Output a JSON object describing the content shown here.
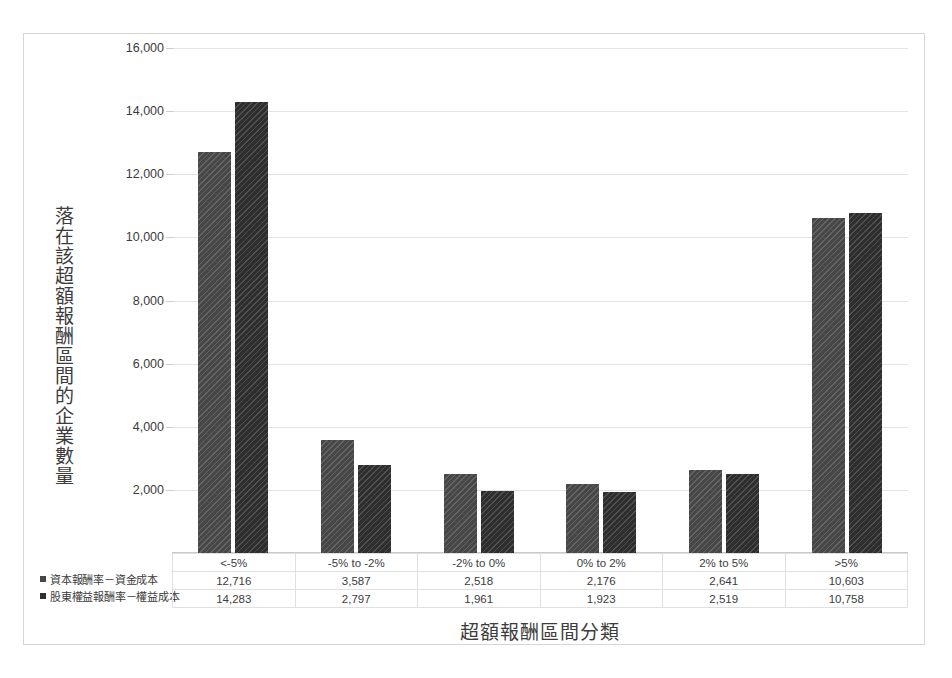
{
  "chart_data": {
    "type": "bar",
    "title": "",
    "xlabel": "超額報酬區間分類",
    "ylabel": "落在該超額報酬區間的企業數量",
    "categories": [
      "<-5%",
      "-5% to  -2%",
      "-2% to 0%",
      "0% to 2%",
      "2% to 5%",
      ">5%"
    ],
    "series": [
      {
        "name": "資本報酬率－資金成本",
        "values": [
          12716,
          3587,
          2518,
          2176,
          2641,
          10603
        ],
        "labels": [
          "12,716",
          "3,587",
          "2,518",
          "2,176",
          "2,641",
          "10,603"
        ],
        "color": "#474747"
      },
      {
        "name": "股東權益報酬率－權益成本",
        "values": [
          14283,
          2797,
          1961,
          1923,
          2519,
          10758
        ],
        "labels": [
          "14,283",
          "2,797",
          "1,961",
          "1,923",
          "2,519",
          "10,758"
        ],
        "color": "#2e2e2e"
      }
    ],
    "ylim": [
      0,
      16000
    ],
    "ytick_values": [
      16000,
      14000,
      12000,
      10000,
      8000,
      6000,
      4000,
      2000
    ],
    "ytick_labels": [
      "16,000",
      "14,000",
      "12,000",
      "10,000",
      "8,000",
      "6,000",
      "4,000",
      "2,000"
    ],
    "grid": true,
    "legend_position": "bottom-left-of-data-table",
    "has_data_table": true
  }
}
